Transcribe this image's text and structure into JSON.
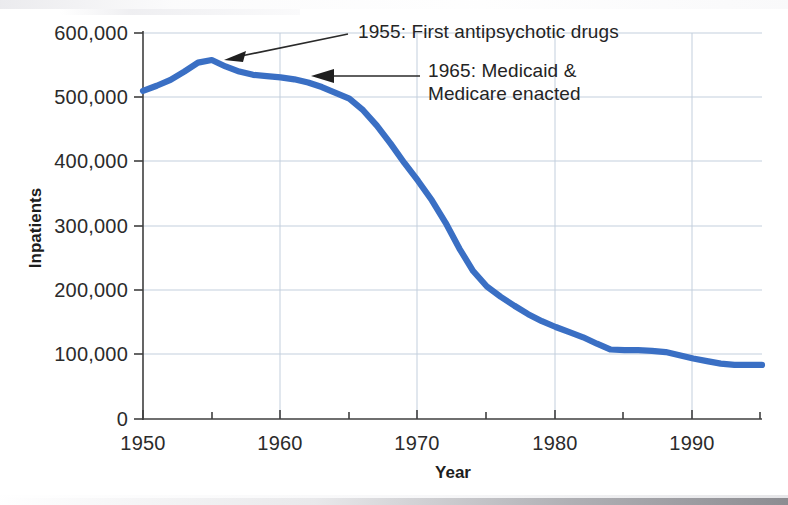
{
  "chart_data": {
    "type": "line",
    "title": "",
    "xlabel": "Year",
    "ylabel": "Inpatients",
    "xlim": [
      1950,
      1995
    ],
    "ylim": [
      0,
      600000
    ],
    "grid": true,
    "legend": "none",
    "line_color": "#3a6fc4",
    "x_ticks": [
      1950,
      1960,
      1970,
      1980,
      1990
    ],
    "x_tick_labels": [
      "1950",
      "1960",
      "1970",
      "1980",
      "1990"
    ],
    "x_minor_tick_interval": 5,
    "y_ticks": [
      0,
      100000,
      200000,
      300000,
      400000,
      500000,
      600000
    ],
    "y_tick_labels": [
      "0",
      "100,000",
      "200,000",
      "300,000",
      "400,000",
      "500,000",
      "600,000"
    ],
    "series": [
      {
        "name": "Inpatients in state and county mental hospitals",
        "x": [
          1950,
          1951,
          1952,
          1953,
          1954,
          1955,
          1956,
          1957,
          1958,
          1959,
          1960,
          1961,
          1962,
          1963,
          1964,
          1965,
          1966,
          1967,
          1968,
          1969,
          1970,
          1971,
          1972,
          1973,
          1974,
          1975,
          1976,
          1977,
          1978,
          1979,
          1980,
          1981,
          1982,
          1983,
          1984,
          1985,
          1986,
          1987,
          1988,
          1989,
          1990,
          1991,
          1992,
          1993,
          1994,
          1995
        ],
        "values": [
          510000,
          518000,
          527000,
          540000,
          554000,
          558000,
          548000,
          540000,
          535000,
          533000,
          531000,
          528000,
          523000,
          516000,
          507000,
          498000,
          480000,
          456000,
          428000,
          398000,
          370000,
          340000,
          305000,
          265000,
          230000,
          206000,
          190000,
          176000,
          163000,
          152000,
          143000,
          135000,
          127000,
          117000,
          108000,
          107000,
          107000,
          106000,
          104000,
          99000,
          94000,
          90000,
          86000,
          84000,
          84000,
          84000
        ]
      }
    ],
    "annotations": [
      {
        "id": "annotation-1955",
        "text_line1": "1955: First antipsychotic drugs",
        "text_line2": "",
        "points_to_year": 1955,
        "points_to_value": 558000
      },
      {
        "id": "annotation-1965",
        "text_line1": "1965: Medicaid &",
        "text_line2": "Medicare enacted",
        "points_to_year": 1964,
        "points_to_value": 507000
      }
    ]
  }
}
